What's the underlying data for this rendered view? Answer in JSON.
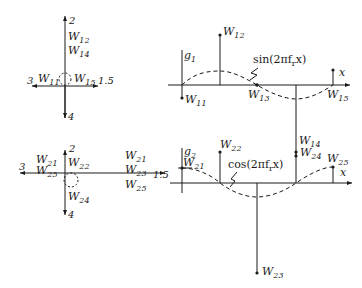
{
  "diagram": {
    "panels": [
      {
        "id": "top-left-polar",
        "axis_labels": {
          "up": "2",
          "down": "4",
          "left": "3",
          "right": "1.5"
        },
        "weights": [
          "W12",
          "W14",
          "W11",
          "W15"
        ]
      },
      {
        "id": "top-right-sine",
        "filter_label": "g",
        "filter_sub": "1",
        "axis_label": "x",
        "function_label": "sin(2πf",
        "function_sub": "r",
        "function_tail": "x)",
        "weights": [
          "W11",
          "W12",
          "W13",
          "W14",
          "W15"
        ]
      },
      {
        "id": "bottom-left-polar",
        "axis_labels": {
          "up": "2",
          "down": "4",
          "left": "3",
          "right": "1.5"
        },
        "weights": [
          "W21",
          "W25",
          "W22",
          "W24",
          "W21",
          "W23",
          "W25"
        ]
      },
      {
        "id": "bottom-right-cosine",
        "filter_label": "g",
        "filter_sub": "2",
        "axis_label": "x",
        "function_label": "cos(2πf",
        "function_sub": "r",
        "function_tail": "x)",
        "weights": [
          "W21",
          "W22",
          "W23",
          "W24",
          "W25"
        ]
      }
    ],
    "labels": {
      "W": "W",
      "s11": "11",
      "s12": "12",
      "s13": "13",
      "s14": "14",
      "s15": "15",
      "s21": "21",
      "s22": "22",
      "s23": "23",
      "s24": "24",
      "s25": "25",
      "n2": "2",
      "n4": "4",
      "n3": "3",
      "n15": "1.5",
      "x": "x",
      "g": "g",
      "g1sub": "1",
      "g2sub": "2",
      "sin": "sin(2πf",
      "cos": "cos(2πf",
      "r": "r",
      "tail": "x)"
    }
  }
}
